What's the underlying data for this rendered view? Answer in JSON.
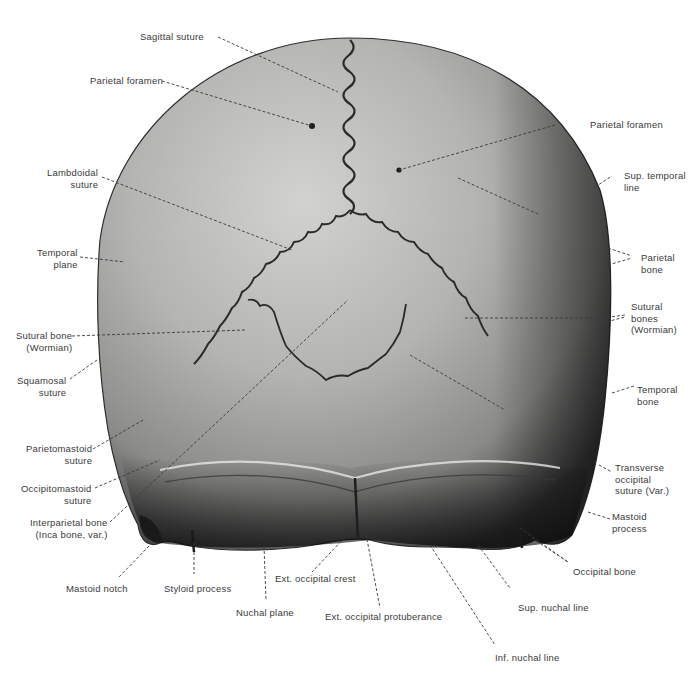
{
  "figure": {
    "colors": {
      "background": "#ffffff",
      "bone_light": "#c9c9c7",
      "bone_mid": "#8f8f8d",
      "bone_dark": "#2e2e2e",
      "label_text": "#3a3a3a",
      "leader_line": "#3a3a3a"
    }
  },
  "labels": {
    "left": [
      {
        "id": "sagittal-suture",
        "text": "Sagittal suture"
      },
      {
        "id": "parietal-foramen-left",
        "text": "Parietal foramen"
      },
      {
        "id": "lambdoidal-suture",
        "text": "Lambdoidal\nsuture"
      },
      {
        "id": "temporal-plane",
        "text": "Temporal\nplane"
      },
      {
        "id": "sutural-bone-wormian",
        "text": "Sutural bone\n(Wormian)"
      },
      {
        "id": "squamosal-suture",
        "text": "Squamosal\nsuture"
      },
      {
        "id": "parietomastoid-suture",
        "text": "Parietomastoid\nsuture"
      },
      {
        "id": "occipitomastoid-suture",
        "text": "Occipitomastoid\nsuture"
      },
      {
        "id": "interparietal-bone",
        "text": "Interparietal bone\n(Inca bone, var.)"
      }
    ],
    "right": [
      {
        "id": "parietal-foramen-right",
        "text": "Parietal foramen"
      },
      {
        "id": "sup-temporal-line",
        "text": "Sup. temporal\nline"
      },
      {
        "id": "parietal-bone",
        "text": "Parietal\nbone"
      },
      {
        "id": "sutural-bones-wormian",
        "text": "Sutural\nbones\n(Wormian)"
      },
      {
        "id": "temporal-bone",
        "text": "Temporal\nbone"
      },
      {
        "id": "transverse-occipital-suture",
        "text": "Transverse\noccipital\nsuture (Var.)"
      },
      {
        "id": "mastoid-process",
        "text": "Mastoid\nprocess"
      },
      {
        "id": "occipital-bone",
        "text": "Occipital bone"
      }
    ],
    "bottom": [
      {
        "id": "mastoid-notch",
        "text": "Mastoid notch"
      },
      {
        "id": "styloid-process",
        "text": "Styloid process"
      },
      {
        "id": "ext-occipital-crest",
        "text": "Ext. occipital crest"
      },
      {
        "id": "nuchal-plane",
        "text": "Nuchal plane"
      },
      {
        "id": "ext-occipital-protuberance",
        "text": "Ext. occipital protuberance"
      },
      {
        "id": "sup-nuchal-line",
        "text": "Sup. nuchal line"
      },
      {
        "id": "inf-nuchal-line",
        "text": "Inf. nuchal line"
      }
    ]
  }
}
